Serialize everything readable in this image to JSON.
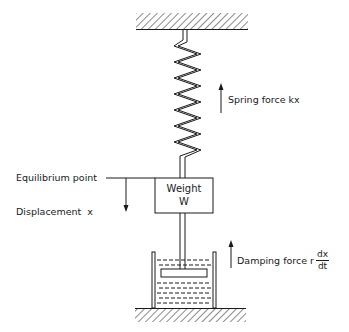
{
  "diagram": {
    "type": "spring-mass-damper system",
    "labels": {
      "spring_force": "Spring force kx",
      "equilibrium": "Equilibrium point",
      "displacement": "Displacement  x",
      "weight_line1": "Weight",
      "weight_line2": "W",
      "damping_force": "Damping force r",
      "damping_num": "dx",
      "damping_den": "dt"
    },
    "colors": {
      "stroke": "#1a1a1a",
      "background": "#ffffff"
    }
  }
}
